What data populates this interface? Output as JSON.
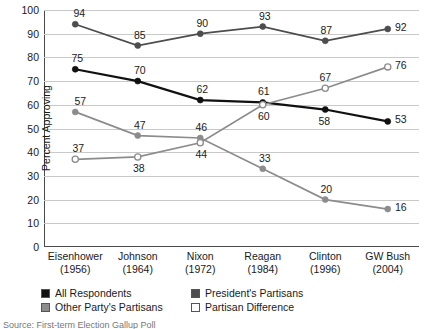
{
  "chart_data": {
    "type": "line",
    "title": "",
    "xlabel": "",
    "ylabel": "Percent Approving",
    "ylim": [
      0,
      100
    ],
    "ytick_step": 10,
    "grid": true,
    "legend_position": "bottom-left",
    "categories": [
      "Eisenhower",
      "Johnson",
      "Nixon",
      "Reagan",
      "Clinton",
      "GW Bush"
    ],
    "category_years": [
      "(1956)",
      "(1964)",
      "(1972)",
      "(1984)",
      "(1996)",
      "(2004)"
    ],
    "yticks": [
      0,
      10,
      20,
      30,
      40,
      50,
      60,
      70,
      80,
      90,
      100
    ],
    "series": [
      {
        "name": "All Respondents",
        "color": "#111111",
        "marker": "filled-circle",
        "line_width": 2.2,
        "values": [
          75,
          70,
          62,
          61,
          58,
          53
        ],
        "label_offsets": [
          {
            "dx": 2,
            "dy": -11
          },
          {
            "dx": 2,
            "dy": -11
          },
          {
            "dx": 2,
            "dy": -11
          },
          {
            "dx": 1,
            "dy": -11
          },
          {
            "dx": -1,
            "dy": 11
          },
          {
            "dx": 13,
            "dy": -2
          }
        ]
      },
      {
        "name": "President's Partisans",
        "color": "#4d4d4d",
        "marker": "filled-circle",
        "line_width": 1.7,
        "values": [
          94,
          85,
          90,
          93,
          87,
          92
        ],
        "label_offsets": [
          {
            "dx": 4,
            "dy": -11
          },
          {
            "dx": 2,
            "dy": -11
          },
          {
            "dx": 2,
            "dy": -11
          },
          {
            "dx": 2,
            "dy": -11
          },
          {
            "dx": 1,
            "dy": -11
          },
          {
            "dx": 13,
            "dy": -2
          }
        ]
      },
      {
        "name": "Other Party's Partisans",
        "color": "#8c8c8c",
        "marker": "filled-circle",
        "line_width": 1.7,
        "values": [
          57,
          47,
          46,
          33,
          20,
          16
        ],
        "label_offsets": [
          {
            "dx": 5,
            "dy": -11
          },
          {
            "dx": 2,
            "dy": -11
          },
          {
            "dx": 1,
            "dy": -11
          },
          {
            "dx": 2,
            "dy": -11
          },
          {
            "dx": 1,
            "dy": -11
          },
          {
            "dx": 13,
            "dy": -2
          }
        ]
      },
      {
        "name": "Partisan Difference",
        "color": "#8c8c8c",
        "marker": "open-circle",
        "line_width": 1.7,
        "values": [
          37,
          38,
          44,
          60,
          67,
          76
        ],
        "label_offsets": [
          {
            "dx": 3,
            "dy": -11
          },
          {
            "dx": 1,
            "dy": 11
          },
          {
            "dx": 1,
            "dy": 11
          },
          {
            "dx": 1,
            "dy": 11
          },
          {
            "dx": 0,
            "dy": -11
          },
          {
            "dx": 13,
            "dy": -2
          }
        ]
      }
    ]
  },
  "legend": {
    "items": [
      {
        "label": "All Respondents",
        "color": "#111111"
      },
      {
        "label": "President's Partisans",
        "color": "#4d4d4d"
      },
      {
        "label": "Other Party's Partisans",
        "color": "#8c8c8c"
      },
      {
        "label": "Partisan Difference",
        "color": "#ffffff"
      }
    ]
  },
  "source": {
    "text": "Source: First-term Election Gallup Poll"
  }
}
